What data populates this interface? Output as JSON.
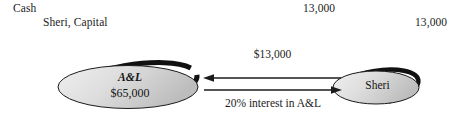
{
  "journal_entry": {
    "debit_account": "Cash",
    "credit_account": "Sheri, Capital",
    "debit_amount": "13,000",
    "credit_amount": "13,000"
  },
  "diagram": {
    "type": "two-node-exchange",
    "nodes": [
      {
        "id": "a-and-l",
        "name": "A&L",
        "amount": "$65,000",
        "shape": "ellipse",
        "fill": "#d9d9d9",
        "outline": "#1a1a1a"
      },
      {
        "id": "sheri",
        "name": "Sheri",
        "shape": "ellipse",
        "fill": "#d9d9d9",
        "outline": "#1a1a1a"
      }
    ],
    "edges": [
      {
        "id": "cash-to-al",
        "label": "$13,000",
        "direction": "right-to-left",
        "label_position": "above"
      },
      {
        "id": "interest-to-sheri",
        "label": "20% interest in A&L",
        "direction": "left-to-right",
        "label_position": "below"
      }
    ]
  },
  "colors": {
    "background": "#ffffff",
    "text": "#1c1c1c",
    "node_fill_light": "#e8e8e8",
    "node_fill_dark": "#c6c6c6",
    "stroke": "#151515"
  }
}
